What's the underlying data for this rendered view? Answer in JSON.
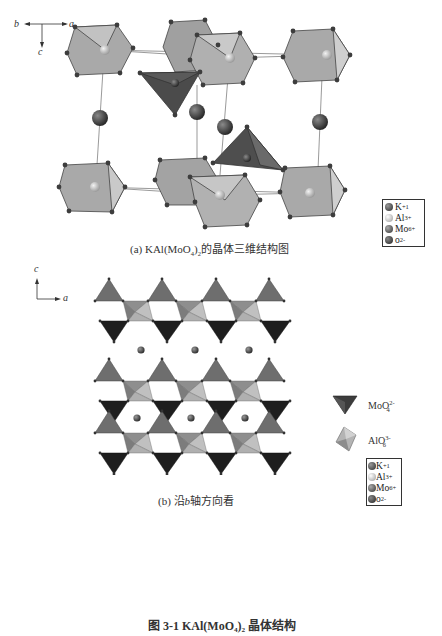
{
  "figure": {
    "number_caption": "图 3-1  KAl(MoO₄)₂ 晶体结构",
    "panel_a": {
      "caption_prefix": "(a) KAl(MoO",
      "caption_sub4": "4",
      "caption_mid": ")",
      "caption_sub2": "2",
      "caption_suffix": "的晶体三维结构图",
      "axes": {
        "b": "b",
        "a": "a",
        "c": "c"
      },
      "legend": [
        {
          "symbol": "K",
          "charge": "+1",
          "color": "#4a4a4a"
        },
        {
          "symbol": "Al",
          "charge": "3+",
          "color": "#c8c8c8"
        },
        {
          "symbol": "Mo",
          "charge": "6+",
          "color": "#555555"
        },
        {
          "symbol": "o",
          "charge": "2-",
          "color": "#3a3a3a"
        }
      ]
    },
    "panel_b": {
      "caption_prefix": "(b) 沿",
      "caption_axis": "b",
      "caption_suffix": "轴方向看",
      "axes": {
        "c": "c",
        "a": "a"
      },
      "polyhedra_legend": [
        {
          "name": "MoO",
          "sub": "4",
          "sup": "2-",
          "shape": "tetrahedron",
          "color": "#3c3c3c"
        },
        {
          "name": "AlO",
          "sub": "6",
          "sup": "3-",
          "shape": "octahedron",
          "color": "#b4b4b4"
        }
      ],
      "legend": [
        {
          "symbol": "K",
          "charge": "+1",
          "color": "#4a4a4a"
        },
        {
          "symbol": "Al",
          "charge": "3+",
          "color": "#c8c8c8"
        },
        {
          "symbol": "Mo",
          "charge": "6+",
          "color": "#555555"
        },
        {
          "symbol": "o",
          "charge": "2-",
          "color": "#3a3a3a"
        }
      ]
    },
    "colors": {
      "octahedron_fill": "#a9a9a9",
      "octahedron_light": "#c9c9c9",
      "tetra_dark": "#4b4b4b",
      "tetra_black": "#1e1e1e",
      "tetra_mid": "#6e6e6e",
      "atom": "#3d3d3d"
    }
  }
}
